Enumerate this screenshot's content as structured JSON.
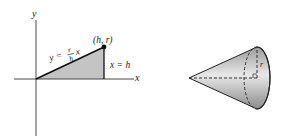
{
  "figure": {
    "left_panel": {
      "axis_labels": {
        "x": "x",
        "y": "y"
      },
      "line_equation": {
        "lhs": "y =",
        "frac_num": "r",
        "frac_den": "h",
        "rhs": "x"
      },
      "point_label": "(h, r)",
      "vertical_line_label": "x = h",
      "region_fill": "#c4c4c4"
    },
    "right_panel": {
      "radius_label": "r",
      "cone_shade_dark": "#8a8a8a",
      "cone_shade_light": "#e6e6e6"
    }
  }
}
